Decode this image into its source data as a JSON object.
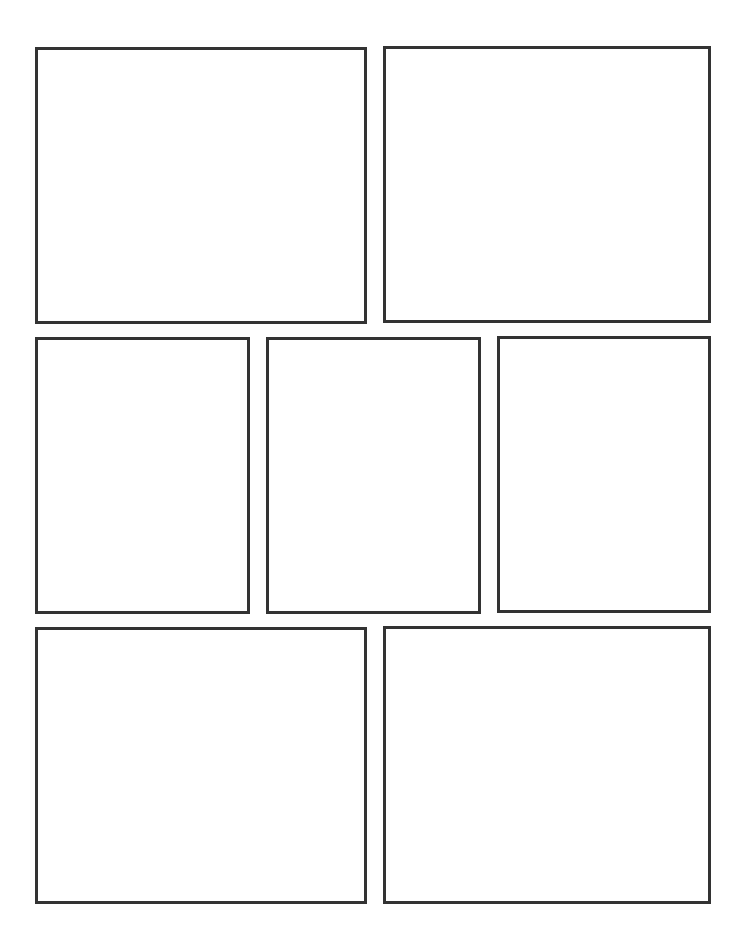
{
  "page": {
    "background": "#ffffff",
    "border_color": "#333333",
    "border_width": 3,
    "rows": 3
  },
  "panels": [
    {
      "id": "panel-1",
      "row": 1,
      "left": 35,
      "top": 47,
      "width": 332,
      "height": 277
    },
    {
      "id": "panel-2",
      "row": 1,
      "left": 383,
      "top": 46,
      "width": 328,
      "height": 277
    },
    {
      "id": "panel-3",
      "row": 2,
      "left": 35,
      "top": 337,
      "width": 215,
      "height": 277
    },
    {
      "id": "panel-4",
      "row": 2,
      "left": 266,
      "top": 337,
      "width": 215,
      "height": 277
    },
    {
      "id": "panel-5",
      "row": 2,
      "left": 497,
      "top": 336,
      "width": 214,
      "height": 277
    },
    {
      "id": "panel-6",
      "row": 3,
      "left": 35,
      "top": 627,
      "width": 332,
      "height": 277
    },
    {
      "id": "panel-7",
      "row": 3,
      "left": 383,
      "top": 626,
      "width": 328,
      "height": 278
    }
  ]
}
